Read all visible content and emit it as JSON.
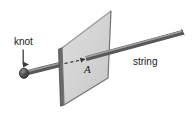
{
  "figure": {
    "background_color": "#ffffff",
    "width": 192,
    "height": 120,
    "labels": {
      "knot": "knot",
      "string": "string",
      "point_a": "A"
    },
    "colors": {
      "plane_fill": "#d2d2d2",
      "plane_fill_light": "#dcdcdc",
      "plane_edge": "#6e6e6e",
      "plane_thickness_dark": "#5a5a5a",
      "string_dark": "#5e5e5e",
      "string_light": "#9a9a9a",
      "knot_fill": "#4a4a4a",
      "text": "#1a1a1a",
      "dashed_line": "#3a3a3a",
      "arrow": "#3a3a3a"
    },
    "geometry": {
      "plane_vertices": "62,48 111,11 108,78 64,105",
      "plane_side_face": "59,49 62,48 64,105 61,106",
      "string_start_x": 24,
      "string_start_y": 73,
      "string_end_x": 183,
      "string_end_y": 32,
      "knot_x": 24,
      "knot_y": 73,
      "point_a_x": 88,
      "point_a_y": 58,
      "dash_start_x": 64,
      "dash_start_y": 63,
      "dash_end_x": 86,
      "dash_end_y": 59,
      "knot_arrow_x": 23,
      "knot_arrow_y_top": 50,
      "knot_arrow_y_bottom": 65
    }
  }
}
